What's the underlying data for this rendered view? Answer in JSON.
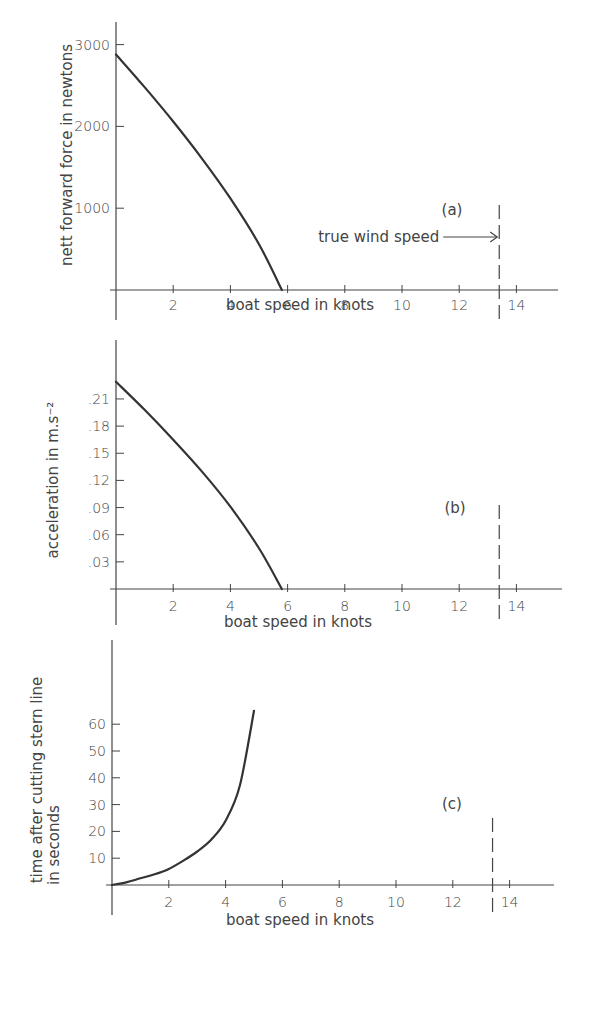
{
  "chart_data": [
    {
      "id": "a",
      "type": "line",
      "panel_label": "(a)",
      "title": "",
      "xlabel": "boat speed in knots",
      "ylabel": "nett forward force in newtons",
      "xlim": [
        0,
        16
      ],
      "ylim": [
        0,
        3200
      ],
      "x_ticks": [
        2,
        4,
        6,
        8,
        10,
        12,
        14
      ],
      "x_tick_labels": [
        "2",
        "4",
        "6",
        "8",
        "10",
        "12",
        "14"
      ],
      "y_ticks": [
        1000,
        2000,
        3000
      ],
      "y_tick_labels": [
        "1000",
        "2000",
        "3000"
      ],
      "series": [
        {
          "name": "nett forward force",
          "x": [
            0,
            1,
            2,
            3,
            4,
            5,
            5.8
          ],
          "y": [
            2880,
            2480,
            2060,
            1610,
            1120,
            560,
            0
          ]
        }
      ],
      "annotations": [
        {
          "type": "vline",
          "x": 13.4,
          "style": "dashed",
          "label": "true wind speed"
        }
      ],
      "annotation_text": "true wind speed",
      "grid": false
    },
    {
      "id": "b",
      "type": "line",
      "panel_label": "(b)",
      "title": "",
      "xlabel": "boat speed in knots",
      "ylabel": "acceleration in m.s⁻²",
      "xlim": [
        0,
        16
      ],
      "ylim": [
        0,
        0.25
      ],
      "x_ticks": [
        2,
        4,
        6,
        8,
        10,
        12,
        14
      ],
      "x_tick_labels": [
        "2",
        "4",
        "6",
        "8",
        "10",
        "12",
        "14"
      ],
      "y_ticks": [
        0.03,
        0.06,
        0.09,
        0.12,
        0.15,
        0.18,
        0.21
      ],
      "y_tick_labels": [
        ".03",
        ".06",
        ".09",
        ".12",
        ".15",
        ".18",
        ".21"
      ],
      "series": [
        {
          "name": "acceleration",
          "x": [
            0,
            1,
            2,
            3,
            4,
            5,
            5.8
          ],
          "y": [
            0.229,
            0.198,
            0.165,
            0.13,
            0.091,
            0.045,
            0
          ]
        }
      ],
      "annotations": [
        {
          "type": "vline",
          "x": 13.4,
          "style": "dashed"
        }
      ],
      "grid": false
    },
    {
      "id": "c",
      "type": "line",
      "panel_label": "(c)",
      "title": "",
      "xlabel": "boat speed in knots",
      "ylabel": "time after cutting stern line in seconds",
      "ylabel_lines": [
        "time after cutting stern line",
        "in seconds"
      ],
      "xlim": [
        0,
        16
      ],
      "ylim": [
        0,
        70
      ],
      "x_ticks": [
        2,
        4,
        6,
        8,
        10,
        12,
        14
      ],
      "x_tick_labels": [
        "2",
        "4",
        "6",
        "8",
        "10",
        "12",
        "14"
      ],
      "y_ticks": [
        10,
        20,
        30,
        40,
        50,
        60
      ],
      "y_tick_labels": [
        "10",
        "20",
        "30",
        "40",
        "50",
        "60"
      ],
      "series": [
        {
          "name": "time",
          "x": [
            0,
            0.5,
            1,
            1.5,
            2,
            2.5,
            3,
            3.5,
            4,
            4.5,
            5
          ],
          "y": [
            0,
            1,
            2.5,
            4,
            6,
            9,
            12.5,
            17,
            24,
            37,
            65
          ]
        }
      ],
      "annotations": [
        {
          "type": "vline",
          "x": 13.4,
          "style": "dashed"
        }
      ],
      "grid": false
    }
  ]
}
